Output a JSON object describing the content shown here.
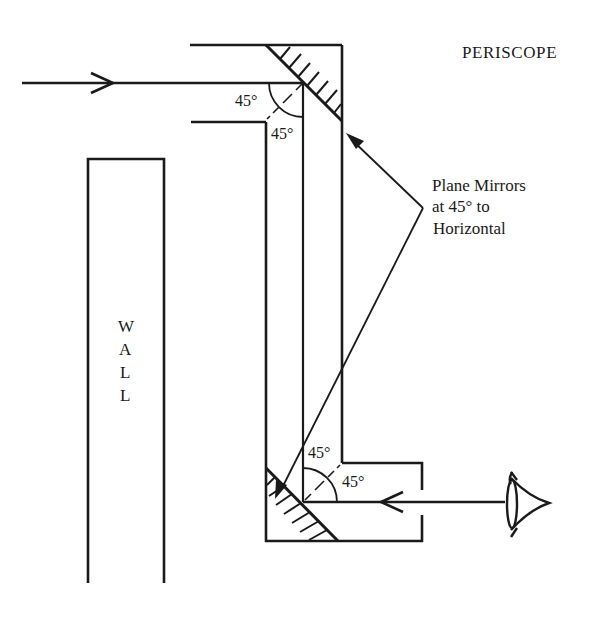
{
  "title": "PERISCOPE",
  "wall_label": [
    "W",
    "A",
    "L",
    "L"
  ],
  "annotation": {
    "lines": [
      "Plane Mirrors",
      "at 45° to",
      "Horizontal"
    ]
  },
  "angles": {
    "top_left": "45°",
    "top_below": "45°",
    "bottom_above": "45°",
    "bottom_right": "45°"
  },
  "colors": {
    "ink": "#1a1a1a",
    "background": "#ffffff"
  },
  "icons": {
    "eye": "eye-icon",
    "incoming_arrow": "arrow-right-icon",
    "viewer_arrow": "arrow-left-icon"
  }
}
